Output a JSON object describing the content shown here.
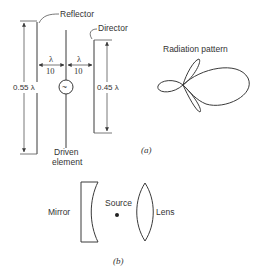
{
  "figure": {
    "part_a": {
      "caption": "(a)",
      "labels": {
        "reflector": "Reflector",
        "director": "Director",
        "driven_element_line1": "Driven",
        "driven_element_line2": "element",
        "reflector_length": "0.55 λ",
        "director_length": "0.45 λ",
        "spacing_left_num": "λ",
        "spacing_left_den": "10",
        "spacing_right_num": "λ",
        "spacing_right_den": "10",
        "source_symbol": "~",
        "radiation_pattern": "Radiation pattern"
      }
    },
    "part_b": {
      "caption": "(b)",
      "labels": {
        "mirror": "Mirror",
        "source": "Source",
        "lens": "Lens"
      }
    },
    "colors": {
      "line": "#3a3a3a",
      "text": "#333333",
      "background": "#ffffff"
    }
  }
}
